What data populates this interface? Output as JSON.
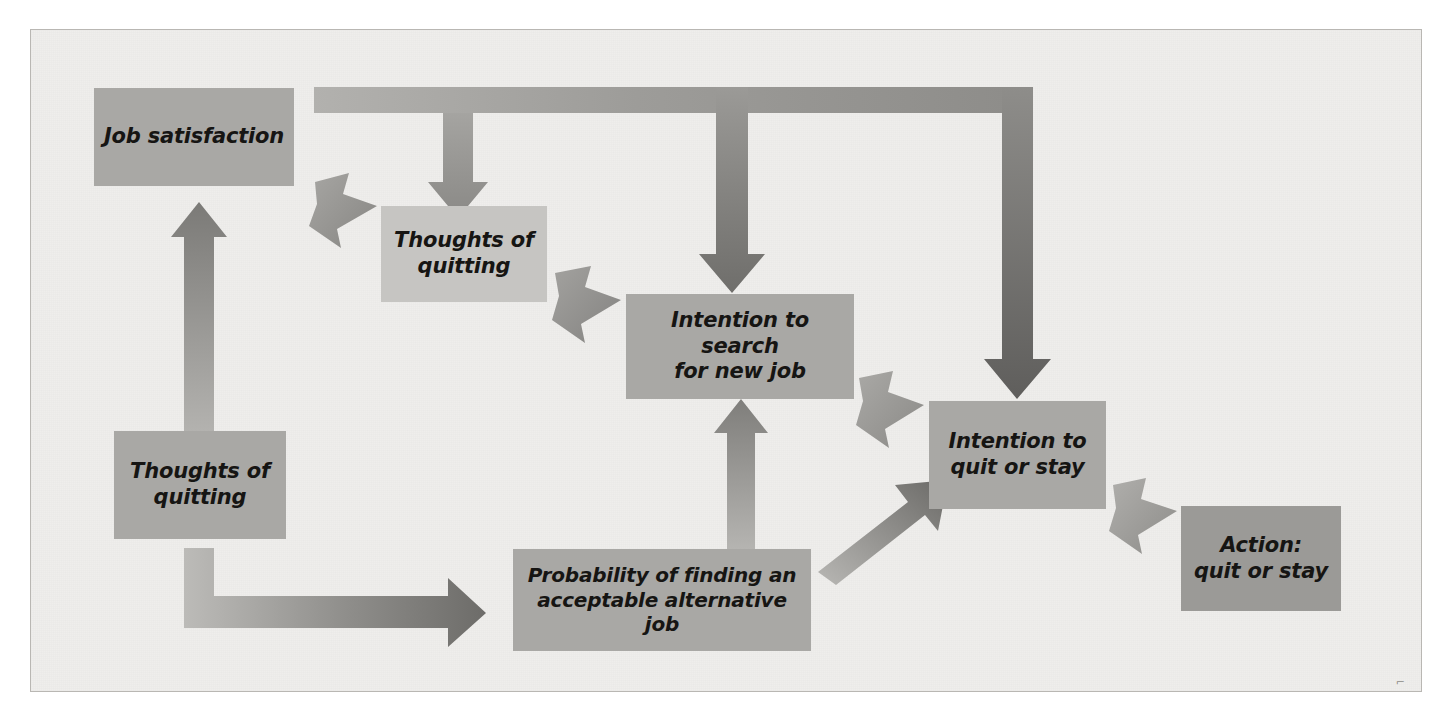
{
  "diagram": {
    "background_color": "#efeeec",
    "border_color": "#b9b7b3",
    "arrow_color_light": "#a9a8a5",
    "arrow_color_dark": "#6e6d6a",
    "text_color": "#161513",
    "nodes": [
      {
        "id": "job-satisfaction",
        "label": "Job satisfaction",
        "fill": "#a9a8a5",
        "x": 63,
        "y": 58,
        "w": 200,
        "h": 98,
        "font_size": 21
      },
      {
        "id": "thoughts-top",
        "label": "Thoughts of\nquitting",
        "fill": "#c6c5c2",
        "x": 350,
        "y": 176,
        "w": 166,
        "h": 96,
        "font_size": 21
      },
      {
        "id": "intention-search",
        "label": "Intention to search\nfor new job",
        "fill": "#a9a8a5",
        "x": 595,
        "y": 264,
        "w": 228,
        "h": 105,
        "font_size": 21
      },
      {
        "id": "thoughts-bottom",
        "label": "Thoughts of\nquitting",
        "fill": "#a9a8a5",
        "x": 83,
        "y": 401,
        "w": 172,
        "h": 108,
        "font_size": 21
      },
      {
        "id": "probability",
        "label": "Probability of finding an\nacceptable alternative job",
        "fill": "#a9a8a5",
        "x": 482,
        "y": 519,
        "w": 298,
        "h": 102,
        "font_size": 20
      },
      {
        "id": "intention-quit",
        "label": "Intention to\nquit or stay",
        "fill": "#a9a8a5",
        "x": 898,
        "y": 371,
        "w": 177,
        "h": 108,
        "font_size": 21
      },
      {
        "id": "action",
        "label": "Action:\nquit or stay",
        "fill": "#9b9a97",
        "x": 1150,
        "y": 476,
        "w": 160,
        "h": 105,
        "font_size": 21
      }
    ],
    "edges": [
      {
        "id": "thoughts-bottom-to-job-satisfaction",
        "kind": "straight-up",
        "from": "thoughts-bottom",
        "to": "job-satisfaction"
      },
      {
        "id": "job-satisfaction-to-thoughts-top",
        "kind": "diagonal",
        "from": "job-satisfaction",
        "to": "thoughts-top"
      },
      {
        "id": "thoughts-top-to-intention-search",
        "kind": "diagonal",
        "from": "thoughts-top",
        "to": "intention-search"
      },
      {
        "id": "feedback-bus",
        "kind": "bus",
        "from": "intention-quit",
        "to": "thoughts-top / intention-search / intention-quit"
      },
      {
        "id": "probability-to-intention-search",
        "kind": "straight-up",
        "from": "probability",
        "to": "intention-search"
      },
      {
        "id": "thoughts-bottom-to-probability",
        "kind": "elbow-right",
        "from": "thoughts-bottom",
        "to": "probability"
      },
      {
        "id": "intention-search-to-intention-quit",
        "kind": "diagonal-down",
        "from": "intention-search",
        "to": "intention-quit"
      },
      {
        "id": "probability-to-intention-quit",
        "kind": "diagonal-up",
        "from": "probability",
        "to": "intention-quit"
      },
      {
        "id": "intention-quit-to-action",
        "kind": "diagonal-down",
        "from": "intention-quit",
        "to": "action"
      }
    ],
    "corner_mark": "⌐"
  }
}
